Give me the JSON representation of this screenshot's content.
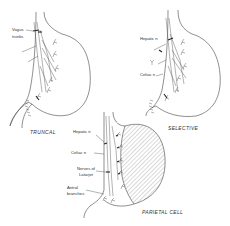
{
  "diagram": {
    "panels": [
      {
        "id": "truncal",
        "caption": "TRUNCAL",
        "labels": [
          "Vagus",
          "trunks"
        ]
      },
      {
        "id": "selective",
        "caption": "SELECTIVE",
        "labels": [
          "Hepatic n",
          "Celiac n"
        ]
      },
      {
        "id": "parietal-cell",
        "caption": "PARIETAL CELL",
        "labels": [
          "Hepatic n",
          "Celiac n",
          "Nerves of",
          "Latarjet",
          "Antral",
          "branches"
        ]
      }
    ],
    "colors": {
      "line": "#444444",
      "background": "#ffffff",
      "hatch": "#666666"
    }
  }
}
